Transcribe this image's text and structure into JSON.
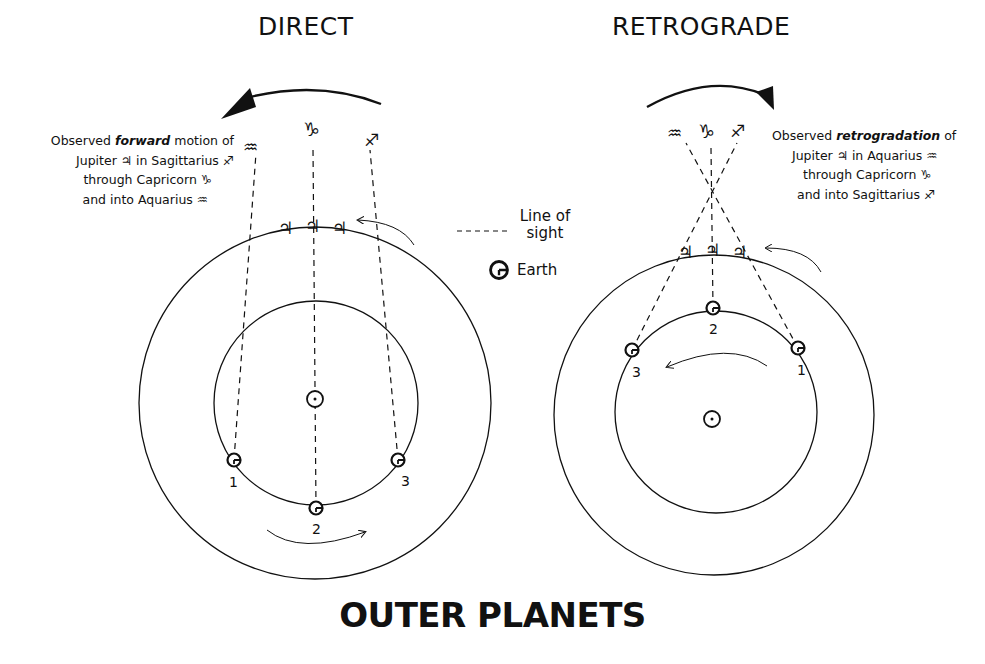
{
  "figure": {
    "main_title": "OUTER PLANETS",
    "colors": {
      "ink": "#111111",
      "background": "#ffffff"
    }
  },
  "legend": {
    "line_of_sight_label_1": "Line of",
    "line_of_sight_label_2": "sight",
    "earth_label": "Earth",
    "earth_icon": "earth-symbol-circle-g"
  },
  "direct": {
    "title": "DIRECT",
    "caption": {
      "line1_pre": "Observed ",
      "line1_em": "forward",
      "line1_post": " motion of",
      "line2": "Jupiter ♃ in Sagittarius ♐",
      "line3": "through Capricorn ♑",
      "line4": "and into Aquarius ♒"
    },
    "signs": {
      "aquarius": "♒",
      "capricorn": "♑",
      "sagittarius": "♐"
    },
    "jupiter_symbol": "♃",
    "sun_symbol": "☉",
    "earth_positions": [
      "1",
      "2",
      "3"
    ]
  },
  "retrograde": {
    "title": "RETROGRADE",
    "caption": {
      "line1_pre": "Observed ",
      "line1_em": "retrogradation",
      "line1_post": " of",
      "line2": "Jupiter ♃ in Aquarius ♒",
      "line3": "through Capricorn ♑",
      "line4": "and into Sagittarius ♐"
    },
    "signs": {
      "aquarius": "♒",
      "capricorn": "♑",
      "sagittarius": "♐"
    },
    "jupiter_symbol": "♃",
    "sun_symbol": "☉",
    "earth_positions": [
      "1",
      "2",
      "3"
    ]
  }
}
